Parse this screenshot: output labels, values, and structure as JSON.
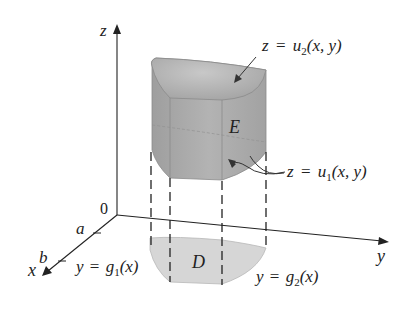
{
  "figure": {
    "axes": {
      "z_label": "z",
      "y_label": "y",
      "x_label": "x",
      "origin_label": "0"
    },
    "x_ticks": {
      "a": "a",
      "b": "b"
    },
    "solid": {
      "label": "E",
      "upper_surface": {
        "lhs": "z",
        "eq": "=",
        "fn": "u",
        "sub": "2",
        "args": "(x, y)"
      },
      "lower_surface": {
        "lhs": "z",
        "eq": "=",
        "fn": "u",
        "sub": "1",
        "args": "(x, y)"
      }
    },
    "region": {
      "label": "D",
      "left_boundary": {
        "lhs": "y",
        "eq": "=",
        "fn": "g",
        "sub": "1",
        "args": "(x)"
      },
      "right_boundary": {
        "lhs": "y",
        "eq": "=",
        "fn": "g",
        "sub": "2",
        "args": "(x)"
      }
    },
    "colors": {
      "solid_fill": "#a9a9a9",
      "solid_top_fill": "#b8b8b8",
      "region_fill": "#d6d6d6",
      "line": "#222222"
    }
  }
}
